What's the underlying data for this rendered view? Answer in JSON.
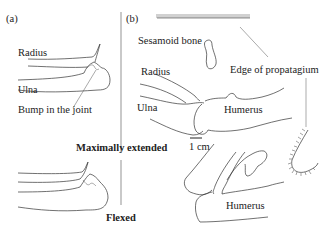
{
  "figure": {
    "panel_a": {
      "label": "(a)",
      "labels": {
        "radius": "Radius",
        "ulna": "Ulna",
        "bump": "Bump in the joint"
      }
    },
    "panel_b": {
      "label": "(b)",
      "labels": {
        "sesamoid": "Sesamoid bone",
        "propatagium": "Edge of propatagium",
        "radius": "Radius",
        "ulna": "Ulna",
        "humerus_top": "Humerus",
        "humerus_bottom": "Humerus"
      },
      "scale_bar": "1 cm"
    },
    "states": {
      "extended": "Maximally extended",
      "flexed": "Flexed"
    },
    "colors": {
      "line": "#333333",
      "text": "#222222",
      "background": "#ffffff"
    }
  }
}
